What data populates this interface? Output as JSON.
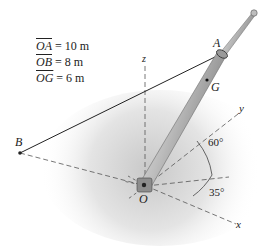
{
  "given": [
    {
      "segment": "OA",
      "value": "= 10 m"
    },
    {
      "segment": "OB",
      "value": "= 8 m"
    },
    {
      "segment": "OG",
      "value": "= 6 m"
    }
  ],
  "labels": {
    "A": "A",
    "B": "B",
    "G": "G",
    "O": "O",
    "x": "x",
    "y": "y",
    "z": "z"
  },
  "angles": {
    "upper": "60°",
    "lower": "35°"
  },
  "colors": {
    "line": "#222222",
    "dash": "#555555",
    "pole_light": "#e0e0e0",
    "pole_dark": "#8a8a8a",
    "shadow": "#d4d4d4"
  }
}
